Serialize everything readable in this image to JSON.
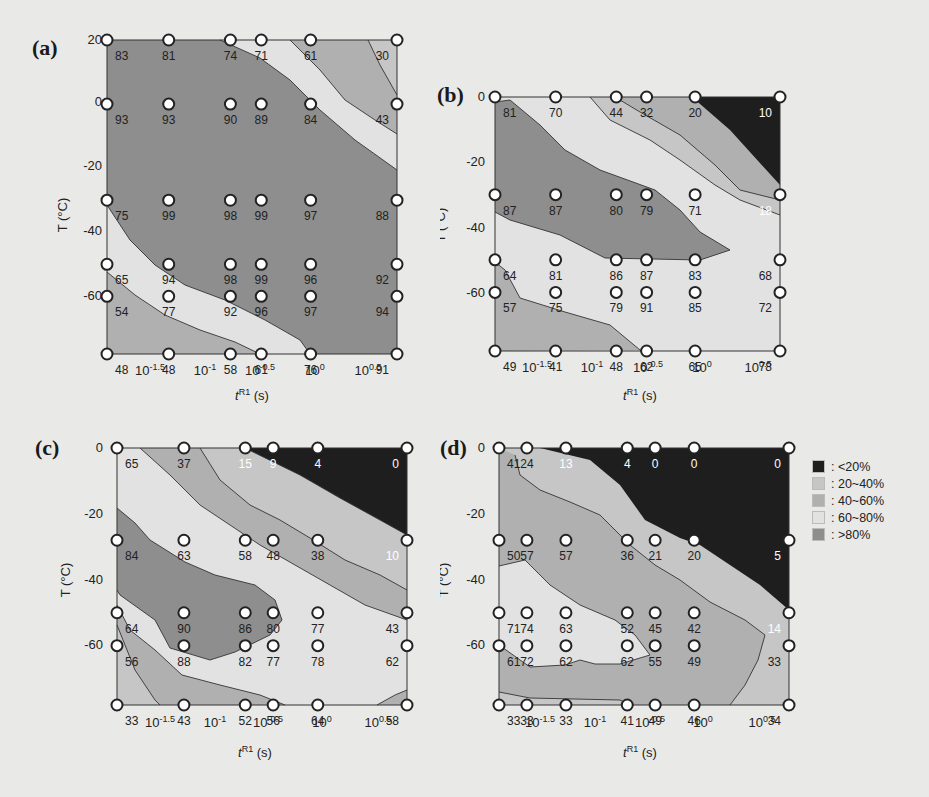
{
  "figure": {
    "legend": [
      {
        "label": ": <20%",
        "color": "#1e1e1e"
      },
      {
        "label": ": 20~40%",
        "color": "#c6c6c6"
      },
      {
        "label": ": 40~60%",
        "color": "#b0b0b0"
      },
      {
        "label": ": 60~80%",
        "color": "#e2e2e2"
      },
      {
        "label": ": >80%",
        "color": "#8e8e8e"
      }
    ]
  },
  "chart_data": [
    {
      "panel": "(a)",
      "type": "heatmap",
      "subtype": "contour",
      "xlabel": "tR1 (s)",
      "ylabel": "T (°C)",
      "x_scale": "log",
      "x_ticks": [
        "10-1.5",
        "10-1",
        "10-0.5",
        "100",
        "100.5"
      ],
      "y_ticks": [
        20,
        0,
        -20,
        -40,
        -60
      ],
      "ylim": [
        -78,
        20
      ],
      "points": [
        {
          "x": -1.75,
          "T": 20,
          "v": 83
        },
        {
          "x": -1.25,
          "T": 20,
          "v": 81
        },
        {
          "x": -0.75,
          "T": 20,
          "v": 74
        },
        {
          "x": -0.5,
          "T": 20,
          "v": 71
        },
        {
          "x": -0.1,
          "T": 20,
          "v": 61
        },
        {
          "x": 0.6,
          "T": 20,
          "v": 30
        },
        {
          "x": -1.75,
          "T": 0,
          "v": 93
        },
        {
          "x": -1.25,
          "T": 0,
          "v": 93
        },
        {
          "x": -0.75,
          "T": 0,
          "v": 90
        },
        {
          "x": -0.5,
          "T": 0,
          "v": 89
        },
        {
          "x": -0.1,
          "T": 0,
          "v": 84
        },
        {
          "x": 0.6,
          "T": 0,
          "v": 43
        },
        {
          "x": -1.75,
          "T": -30,
          "v": 75
        },
        {
          "x": -1.25,
          "T": -30,
          "v": 99
        },
        {
          "x": -0.75,
          "T": -30,
          "v": 98
        },
        {
          "x": -0.5,
          "T": -30,
          "v": 99
        },
        {
          "x": -0.1,
          "T": -30,
          "v": 97
        },
        {
          "x": 0.6,
          "T": -30,
          "v": 88
        },
        {
          "x": -1.75,
          "T": -50,
          "v": 65
        },
        {
          "x": -1.25,
          "T": -50,
          "v": 94
        },
        {
          "x": -0.75,
          "T": -50,
          "v": 98
        },
        {
          "x": -0.5,
          "T": -50,
          "v": 99
        },
        {
          "x": -0.1,
          "T": -50,
          "v": 96
        },
        {
          "x": 0.6,
          "T": -50,
          "v": 92
        },
        {
          "x": -1.75,
          "T": -60,
          "v": 54
        },
        {
          "x": -1.25,
          "T": -60,
          "v": 77
        },
        {
          "x": -0.75,
          "T": -60,
          "v": 92
        },
        {
          "x": -0.5,
          "T": -60,
          "v": 96
        },
        {
          "x": -0.1,
          "T": -60,
          "v": 97
        },
        {
          "x": 0.6,
          "T": -60,
          "v": 94
        },
        {
          "x": -1.75,
          "T": -78,
          "v": 48
        },
        {
          "x": -1.25,
          "T": -78,
          "v": 48
        },
        {
          "x": -0.75,
          "T": -78,
          "v": 58
        },
        {
          "x": -0.5,
          "T": -78,
          "v": 61
        },
        {
          "x": -0.1,
          "T": -78,
          "v": 76
        },
        {
          "x": 0.6,
          "T": -78,
          "v": 91
        }
      ]
    },
    {
      "panel": "(b)",
      "type": "heatmap",
      "subtype": "contour",
      "xlabel": "tR1 (s)",
      "ylabel": "T (°C)",
      "x_scale": "log",
      "x_ticks": [
        "10-1.5",
        "10-1",
        "10-0.5",
        "100",
        "100.5"
      ],
      "y_ticks": [
        0,
        -20,
        -40,
        -60
      ],
      "ylim": [
        -78,
        0
      ],
      "points": [
        {
          "x": -1.75,
          "T": 0,
          "v": 81
        },
        {
          "x": -1.25,
          "T": 0,
          "v": 70
        },
        {
          "x": -0.75,
          "T": 0,
          "v": 44
        },
        {
          "x": -0.5,
          "T": 0,
          "v": 32
        },
        {
          "x": -0.1,
          "T": 0,
          "v": 20
        },
        {
          "x": 0.6,
          "T": 0,
          "v": 10
        },
        {
          "x": -1.75,
          "T": -30,
          "v": 87
        },
        {
          "x": -1.25,
          "T": -30,
          "v": 87
        },
        {
          "x": -0.75,
          "T": -30,
          "v": 80
        },
        {
          "x": -0.5,
          "T": -30,
          "v": 79
        },
        {
          "x": -0.1,
          "T": -30,
          "v": 71
        },
        {
          "x": 0.6,
          "T": -30,
          "v": 18
        },
        {
          "x": -1.75,
          "T": -50,
          "v": 64
        },
        {
          "x": -1.25,
          "T": -50,
          "v": 81
        },
        {
          "x": -0.75,
          "T": -50,
          "v": 86
        },
        {
          "x": -0.5,
          "T": -50,
          "v": 87
        },
        {
          "x": -0.1,
          "T": -50,
          "v": 83
        },
        {
          "x": 0.6,
          "T": -50,
          "v": 68
        },
        {
          "x": -1.75,
          "T": -60,
          "v": 57
        },
        {
          "x": -1.25,
          "T": -60,
          "v": 75
        },
        {
          "x": -0.75,
          "T": -60,
          "v": 79
        },
        {
          "x": -0.5,
          "T": -60,
          "v": 91
        },
        {
          "x": -0.1,
          "T": -60,
          "v": 85
        },
        {
          "x": 0.6,
          "T": -60,
          "v": 72
        },
        {
          "x": -1.75,
          "T": -78,
          "v": 49
        },
        {
          "x": -1.25,
          "T": -78,
          "v": 41
        },
        {
          "x": -0.75,
          "T": -78,
          "v": 48
        },
        {
          "x": -0.5,
          "T": -78,
          "v": 62
        },
        {
          "x": -0.1,
          "T": -78,
          "v": 65
        },
        {
          "x": 0.6,
          "T": -78,
          "v": 78
        }
      ]
    },
    {
      "panel": "(c)",
      "type": "heatmap",
      "subtype": "contour",
      "xlabel": "tR1 (s)",
      "ylabel": "T (°C)",
      "x_scale": "log",
      "x_ticks": [
        "10-1.5",
        "10-1",
        "10-0.5",
        "100",
        "100.5"
      ],
      "y_ticks": [
        0,
        -20,
        -40,
        -60
      ],
      "ylim": [
        -78,
        0
      ],
      "points": [
        {
          "x": -1.9,
          "T": 0,
          "v": 65
        },
        {
          "x": -1.3,
          "T": 0,
          "v": 37
        },
        {
          "x": -0.75,
          "T": 0,
          "v": 15
        },
        {
          "x": -0.5,
          "T": 0,
          "v": 9
        },
        {
          "x": -0.1,
          "T": 0,
          "v": 4
        },
        {
          "x": 0.7,
          "T": 0,
          "v": 0
        },
        {
          "x": -1.9,
          "T": -28,
          "v": 84
        },
        {
          "x": -1.3,
          "T": -28,
          "v": 63
        },
        {
          "x": -0.75,
          "T": -28,
          "v": 58
        },
        {
          "x": -0.5,
          "T": -28,
          "v": 48
        },
        {
          "x": -0.1,
          "T": -28,
          "v": 38
        },
        {
          "x": 0.7,
          "T": -28,
          "v": 10
        },
        {
          "x": -1.9,
          "T": -50,
          "v": 64
        },
        {
          "x": -1.3,
          "T": -50,
          "v": 90
        },
        {
          "x": -0.75,
          "T": -50,
          "v": 86
        },
        {
          "x": -0.5,
          "T": -50,
          "v": 80
        },
        {
          "x": -0.1,
          "T": -50,
          "v": 77
        },
        {
          "x": 0.7,
          "T": -50,
          "v": 43
        },
        {
          "x": -1.9,
          "T": -60,
          "v": 56
        },
        {
          "x": -1.3,
          "T": -60,
          "v": 88
        },
        {
          "x": -0.75,
          "T": -60,
          "v": 82
        },
        {
          "x": -0.5,
          "T": -60,
          "v": 77
        },
        {
          "x": -0.1,
          "T": -60,
          "v": 78
        },
        {
          "x": 0.7,
          "T": -60,
          "v": 62
        },
        {
          "x": -1.9,
          "T": -78,
          "v": 33
        },
        {
          "x": -1.3,
          "T": -78,
          "v": 43
        },
        {
          "x": -0.75,
          "T": -78,
          "v": 52
        },
        {
          "x": -0.5,
          "T": -78,
          "v": 56
        },
        {
          "x": -0.1,
          "T": -78,
          "v": 64
        },
        {
          "x": 0.7,
          "T": -78,
          "v": 58
        }
      ]
    },
    {
      "panel": "(d)",
      "type": "heatmap",
      "subtype": "contour",
      "xlabel": "tR1 (s)",
      "ylabel": "T (°C)",
      "x_scale": "log",
      "x_ticks": [
        "10-1.5",
        "10-1",
        "10-0.5",
        "100",
        "100.5"
      ],
      "y_ticks": [
        0,
        -20,
        -40,
        -60
      ],
      "ylim": [
        -78,
        0
      ],
      "points": [
        {
          "x": -1.9,
          "T": 0,
          "v": 41
        },
        {
          "x": -1.65,
          "T": 0,
          "v": 24
        },
        {
          "x": -1.3,
          "T": 0,
          "v": 13
        },
        {
          "x": -0.75,
          "T": 0,
          "v": 4
        },
        {
          "x": -0.5,
          "T": 0,
          "v": 0
        },
        {
          "x": -0.15,
          "T": 0,
          "v": 0
        },
        {
          "x": 0.7,
          "T": 0,
          "v": 0
        },
        {
          "x": -1.9,
          "T": -28,
          "v": 50
        },
        {
          "x": -1.65,
          "T": -28,
          "v": 57
        },
        {
          "x": -1.3,
          "T": -28,
          "v": 57
        },
        {
          "x": -0.75,
          "T": -28,
          "v": 36
        },
        {
          "x": -0.5,
          "T": -28,
          "v": 21
        },
        {
          "x": -0.15,
          "T": -28,
          "v": 20
        },
        {
          "x": 0.7,
          "T": -28,
          "v": 5
        },
        {
          "x": -1.9,
          "T": -50,
          "v": 71
        },
        {
          "x": -1.65,
          "T": -50,
          "v": 74
        },
        {
          "x": -1.3,
          "T": -50,
          "v": 63
        },
        {
          "x": -0.75,
          "T": -50,
          "v": 52
        },
        {
          "x": -0.5,
          "T": -50,
          "v": 45
        },
        {
          "x": -0.15,
          "T": -50,
          "v": 42
        },
        {
          "x": 0.7,
          "T": -50,
          "v": 14
        },
        {
          "x": -1.9,
          "T": -60,
          "v": 61
        },
        {
          "x": -1.65,
          "T": -60,
          "v": 72
        },
        {
          "x": -1.3,
          "T": -60,
          "v": 62
        },
        {
          "x": -0.75,
          "T": -60,
          "v": 62
        },
        {
          "x": -0.5,
          "T": -60,
          "v": 55
        },
        {
          "x": -0.15,
          "T": -60,
          "v": 49
        },
        {
          "x": 0.7,
          "T": -60,
          "v": 33
        },
        {
          "x": -1.9,
          "T": -78,
          "v": 33
        },
        {
          "x": -1.65,
          "T": -78,
          "v": 33
        },
        {
          "x": -1.3,
          "T": -78,
          "v": 33
        },
        {
          "x": -0.75,
          "T": -78,
          "v": 41
        },
        {
          "x": -0.5,
          "T": -78,
          "v": 49
        },
        {
          "x": -0.15,
          "T": -78,
          "v": 46
        },
        {
          "x": 0.7,
          "T": -78,
          "v": 34
        }
      ]
    }
  ],
  "panels": {
    "a": {
      "label": "(a)",
      "ylabel": "T (°C)",
      "xlabel_main": "t",
      "xlabel_sup": "R1",
      "xlabel_unit": " (s)",
      "yticks": [
        "20",
        "0",
        "-20",
        "-40",
        "-60"
      ],
      "xticks": [
        {
          "base": "10",
          "exp": "-1.5"
        },
        {
          "base": "10",
          "exp": "-1"
        },
        {
          "base": "10",
          "exp": "-0.5"
        },
        {
          "base": "10",
          "exp": "0"
        },
        {
          "base": "10",
          "exp": "0.5"
        }
      ]
    },
    "b": {
      "label": "(b)",
      "ylabel": "T (°C)",
      "xlabel_main": "t",
      "xlabel_sup": "R1",
      "xlabel_unit": " (s)",
      "yticks": [
        "0",
        "-20",
        "-40",
        "-60"
      ],
      "xticks": [
        {
          "base": "10",
          "exp": "-1.5"
        },
        {
          "base": "10",
          "exp": "-1"
        },
        {
          "base": "10",
          "exp": "-0.5"
        },
        {
          "base": "10",
          "exp": "0"
        },
        {
          "base": "10",
          "exp": "0.5"
        }
      ]
    },
    "c": {
      "label": "(c)",
      "ylabel": "T (°C)",
      "xlabel_main": "t",
      "xlabel_sup": "R1",
      "xlabel_unit": " (s)",
      "yticks": [
        "0",
        "-20",
        "-40",
        "-60"
      ],
      "xticks": [
        {
          "base": "10",
          "exp": "-1.5"
        },
        {
          "base": "10",
          "exp": "-1"
        },
        {
          "base": "10",
          "exp": "-0.5"
        },
        {
          "base": "10",
          "exp": "0"
        },
        {
          "base": "10",
          "exp": "0.5"
        }
      ]
    },
    "d": {
      "label": "(d)",
      "ylabel": "T (°C)",
      "xlabel_main": "t",
      "xlabel_sup": "R1",
      "xlabel_unit": " (s)",
      "yticks": [
        "0",
        "-20",
        "-40",
        "-60"
      ],
      "xticks": [
        {
          "base": "10",
          "exp": "-1.5"
        },
        {
          "base": "10",
          "exp": "-1"
        },
        {
          "base": "10",
          "exp": "-0.5"
        },
        {
          "base": "10",
          "exp": "0"
        },
        {
          "base": "10",
          "exp": "0.5"
        }
      ]
    }
  }
}
